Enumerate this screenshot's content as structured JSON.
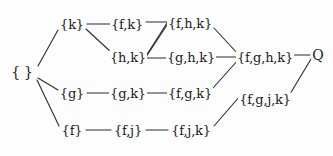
{
  "diagram": {
    "type": "hasse-lattice",
    "line_color": "#2b2b2b",
    "text_color": "#1a1a1a",
    "background": "#fdfdfd",
    "nodes": [
      {
        "id": "empty",
        "label": "{ }",
        "x": 22,
        "y": 72,
        "style": "plain"
      },
      {
        "id": "k",
        "label": "{k}",
        "x": 72,
        "y": 24,
        "style": "set"
      },
      {
        "id": "fk",
        "label": "{f,k}",
        "x": 127,
        "y": 24,
        "style": "set"
      },
      {
        "id": "fhk",
        "label": "{f,h,k}",
        "x": 190,
        "y": 23,
        "style": "set"
      },
      {
        "id": "hk",
        "label": "{h,k}",
        "x": 128,
        "y": 57,
        "style": "set"
      },
      {
        "id": "ghk",
        "label": "{g,h,k}",
        "x": 191,
        "y": 57,
        "style": "set"
      },
      {
        "id": "fghk",
        "label": "{f,g,h,k}",
        "x": 265,
        "y": 57,
        "style": "set"
      },
      {
        "id": "q",
        "label": "Q",
        "x": 318,
        "y": 55,
        "style": "plain"
      },
      {
        "id": "g",
        "label": "{g}",
        "x": 72,
        "y": 93,
        "style": "set"
      },
      {
        "id": "gk",
        "label": "{g,k}",
        "x": 128,
        "y": 93,
        "style": "set"
      },
      {
        "id": "fgk",
        "label": "{f,g,k}",
        "x": 190,
        "y": 93,
        "style": "set"
      },
      {
        "id": "fgjk",
        "label": "{f,g,j,k}",
        "x": 265,
        "y": 99,
        "style": "set"
      },
      {
        "id": "f",
        "label": "{f}",
        "x": 72,
        "y": 130,
        "style": "set"
      },
      {
        "id": "fj",
        "label": "{f,j}",
        "x": 128,
        "y": 130,
        "style": "set"
      },
      {
        "id": "fjk",
        "label": "{f,j,k}",
        "x": 191,
        "y": 130,
        "style": "set"
      }
    ],
    "edges": [
      {
        "from": "empty",
        "to": "k",
        "x1": 38,
        "y1": 66,
        "x2": 58,
        "y2": 30
      },
      {
        "from": "empty",
        "to": "g",
        "x1": 38,
        "y1": 78,
        "x2": 58,
        "y2": 90
      },
      {
        "from": "empty",
        "to": "f",
        "x1": 37,
        "y1": 80,
        "x2": 59,
        "y2": 126
      },
      {
        "from": "k",
        "to": "fk",
        "x1": 87,
        "y1": 24,
        "x2": 110,
        "y2": 24
      },
      {
        "from": "k",
        "to": "hk",
        "x1": 86,
        "y1": 29,
        "x2": 112,
        "y2": 53
      },
      {
        "from": "fk",
        "to": "fhk",
        "x1": 146,
        "y1": 22,
        "x2": 168,
        "y2": 22
      },
      {
        "from": "fk",
        "to": "hk",
        "x1": 167,
        "y1": 23,
        "x2": 146,
        "y2": 56
      },
      {
        "from": "hk",
        "to": "ghk",
        "x1": 146,
        "y1": 58,
        "x2": 167,
        "y2": 58
      },
      {
        "from": "hk",
        "to": "fhk",
        "x1": 146,
        "y1": 57,
        "x2": 167,
        "y2": 25
      },
      {
        "from": "fhk",
        "to": "fghk",
        "x1": 214,
        "y1": 28,
        "x2": 238,
        "y2": 54
      },
      {
        "from": "ghk",
        "to": "fghk",
        "x1": 215,
        "y1": 57,
        "x2": 238,
        "y2": 57
      },
      {
        "from": "fgk",
        "to": "fghk",
        "x1": 213,
        "y1": 88,
        "x2": 238,
        "y2": 60
      },
      {
        "from": "g",
        "to": "gk",
        "x1": 87,
        "y1": 93,
        "x2": 111,
        "y2": 93
      },
      {
        "from": "gk",
        "to": "fgk",
        "x1": 147,
        "y1": 93,
        "x2": 168,
        "y2": 93
      },
      {
        "from": "f",
        "to": "fj",
        "x1": 86,
        "y1": 130,
        "x2": 111,
        "y2": 130
      },
      {
        "from": "fj",
        "to": "fjk",
        "x1": 146,
        "y1": 130,
        "x2": 168,
        "y2": 130
      },
      {
        "from": "fjk",
        "to": "fgjk",
        "x1": 214,
        "y1": 126,
        "x2": 240,
        "y2": 96
      },
      {
        "from": "fghk",
        "to": "q",
        "x1": 293,
        "y1": 55,
        "x2": 310,
        "y2": 55
      },
      {
        "from": "fgjk",
        "to": "q",
        "x1": 290,
        "y1": 94,
        "x2": 311,
        "y2": 59
      }
    ]
  }
}
